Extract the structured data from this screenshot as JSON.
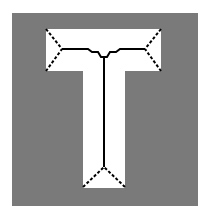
{
  "figure": {
    "colors": {
      "page_background": "#ffffff",
      "region_background": "#7a7a7a",
      "shape_fill": "#ffffff",
      "skeleton_stroke": "#000000"
    },
    "background_rect": {
      "x": 12,
      "y": 13,
      "width": 186,
      "height": 193
    },
    "shape": {
      "name": "letter-T",
      "outline_points": "46,29 161,29 161,71 125,71 125,188 83,188 83,71 46,71"
    },
    "skeleton": {
      "branch_left": "46,29 62,49 46,71",
      "branch_right": "161,29 145,49 161,71",
      "branch_bottom": "83,187 104,167 125,187",
      "top_spine": "62,49 88,49 92,52 98,52 101,57 107,57 110,52 116,52 120,49 145,49",
      "stem_spine": "104,57 104,167"
    }
  }
}
